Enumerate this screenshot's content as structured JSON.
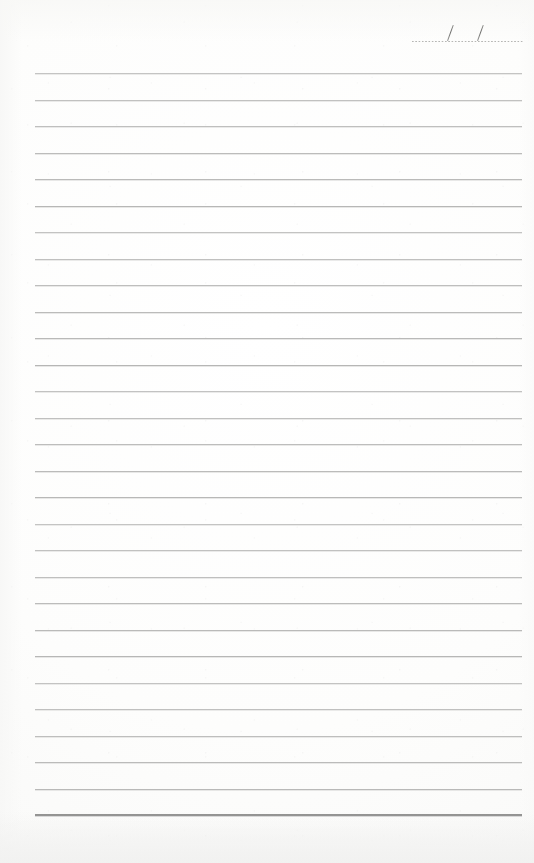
{
  "document": {
    "type": "blank-lined-notebook-page",
    "title": "",
    "paper_color": "#fefefe",
    "rule_color": "#b6b6b5",
    "bottom_rule_color": "#8d8d8c",
    "ink_color": "#6f6f6d"
  },
  "page": {
    "width": 534,
    "height": 863
  },
  "date_field": {
    "label": "",
    "value": "",
    "placeholder": "",
    "separator_1": "/",
    "separator_2": "/",
    "left": 412,
    "right": 524,
    "baseline_y": 41,
    "slash_1_x": 447,
    "slash_2_x": 477,
    "style": "dotted",
    "color": "#a9a9a7"
  },
  "ruled_lines": {
    "count": 28,
    "first_y": 73,
    "spacing": 26.5,
    "left": 35,
    "right": 522,
    "thickness": 1,
    "color": "#b6b6b5"
  },
  "bottom_rule": {
    "y": 814,
    "left": 35,
    "right": 522,
    "thickness": 2,
    "color": "#8d8d8c",
    "style": "double"
  },
  "content": {
    "written_text": "",
    "notes": ""
  }
}
